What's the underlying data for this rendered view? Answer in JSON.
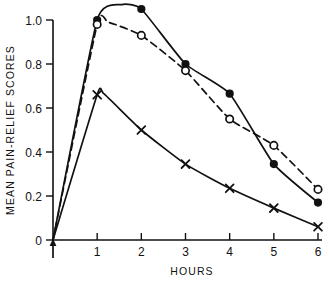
{
  "chart_data": {
    "type": "line",
    "title": "",
    "xlabel": "HOURS",
    "ylabel": "MEAN PAIN-RELIEF SCORES",
    "xlim": [
      0,
      6
    ],
    "ylim": [
      0,
      1.1
    ],
    "xticks": [
      "1",
      "2",
      "3",
      "4",
      "5",
      "6"
    ],
    "xtick_values": [
      1,
      2,
      3,
      4,
      5,
      6
    ],
    "yticks": [
      "0",
      "0.2",
      "0.4",
      "0.6",
      "0.8",
      "1.0"
    ],
    "ytick_values": [
      0,
      0.2,
      0.4,
      0.6,
      0.8,
      1.0
    ],
    "grid": false,
    "legend": "none",
    "x": [
      1,
      2,
      3,
      4,
      5,
      6
    ],
    "series": [
      {
        "name": "filled-circle-series",
        "marker": "filled-circle",
        "linestyle": "solid",
        "color": "#111111",
        "values": [
          1.0,
          1.05,
          0.8,
          0.665,
          0.345,
          0.17
        ],
        "peak_x": 1.55,
        "peak_y": 1.07
      },
      {
        "name": "open-circle-series",
        "marker": "open-circle",
        "linestyle": "dashed",
        "color": "#111111",
        "values": [
          0.98,
          0.93,
          0.77,
          0.55,
          0.43,
          0.23
        ],
        "peak_x": 1.25,
        "peak_y": 0.99
      },
      {
        "name": "cross-series",
        "marker": "x",
        "linestyle": "solid",
        "color": "#111111",
        "values": [
          0.66,
          0.5,
          0.345,
          0.235,
          0.145,
          0.06
        ],
        "peak_x": 1.15,
        "peak_y": 0.665
      }
    ],
    "annotations": [
      {
        "name": "dose-arrow",
        "at_x": 0,
        "at_y": 0,
        "direction": "up",
        "note": "upward arrow at origin"
      }
    ]
  }
}
